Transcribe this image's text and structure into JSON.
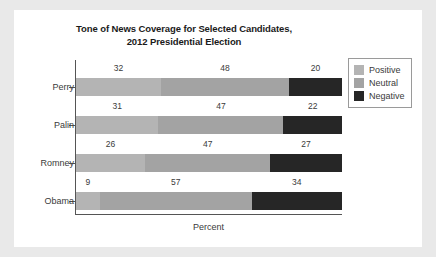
{
  "chart_data": {
    "type": "bar",
    "orientation": "horizontal",
    "stacked": true,
    "title": "Tone of News Coverage for Selected Candidates, 2012 Presidential Election",
    "title_lines": [
      "Tone of News Coverage for Selected Candidates,",
      "2012 Presidential Election"
    ],
    "xlabel": "Percent",
    "ylabel": "",
    "xlim": [
      0,
      100
    ],
    "grid": false,
    "legend_position": "top-right",
    "categories": [
      "Perry",
      "Palin",
      "Romney",
      "Obama"
    ],
    "series": [
      {
        "name": "Positive",
        "color": "#b4b4b4",
        "values": [
          32,
          31,
          26,
          9
        ]
      },
      {
        "name": "Neutral",
        "color": "#a3a3a3",
        "values": [
          48,
          47,
          47,
          57
        ]
      },
      {
        "name": "Negative",
        "color": "#262626",
        "values": [
          20,
          22,
          27,
          34
        ]
      }
    ],
    "rows": [
      {
        "category": "Perry",
        "segments": [
          {
            "series": "Positive",
            "value": 32,
            "label": "32"
          },
          {
            "series": "Neutral",
            "value": 48,
            "label": "48"
          },
          {
            "series": "Negative",
            "value": 20,
            "label": "20"
          }
        ]
      },
      {
        "category": "Palin",
        "segments": [
          {
            "series": "Positive",
            "value": 31,
            "label": "31"
          },
          {
            "series": "Neutral",
            "value": 47,
            "label": "47"
          },
          {
            "series": "Negative",
            "value": 22,
            "label": "22"
          }
        ]
      },
      {
        "category": "Romney",
        "segments": [
          {
            "series": "Positive",
            "value": 26,
            "label": "26"
          },
          {
            "series": "Neutral",
            "value": 47,
            "label": "47"
          },
          {
            "series": "Negative",
            "value": 27,
            "label": "27"
          }
        ]
      },
      {
        "category": "Obama",
        "segments": [
          {
            "series": "Positive",
            "value": 9,
            "label": "9"
          },
          {
            "series": "Neutral",
            "value": 57,
            "label": "57"
          },
          {
            "series": "Negative",
            "value": 34,
            "label": "34"
          }
        ]
      }
    ]
  },
  "legend": {
    "items": [
      {
        "label": "Positive",
        "color": "#b4b4b4"
      },
      {
        "label": "Neutral",
        "color": "#a3a3a3"
      },
      {
        "label": "Negative",
        "color": "#262626"
      }
    ]
  },
  "colors": {
    "page_background": "#e9e9e9",
    "panel_background": "#ffffff",
    "axis": "#555555",
    "text": "#3a3a3a",
    "title": "#1a1a1a",
    "positive": "#b4b4b4",
    "neutral": "#a3a3a3",
    "negative": "#262626"
  }
}
